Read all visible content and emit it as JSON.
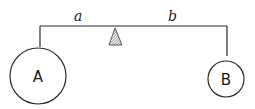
{
  "diagram": {
    "type": "lever-balance",
    "beam_labels": {
      "left_arm": "a",
      "right_arm": "b"
    },
    "masses": [
      {
        "label": "A",
        "size": "large",
        "side": "left"
      },
      {
        "label": "B",
        "size": "small",
        "side": "right"
      }
    ],
    "fulcrum": {
      "shape": "hatched-triangle"
    },
    "colors": {
      "line": "#2a2a2a",
      "background": "#ffffff"
    }
  }
}
